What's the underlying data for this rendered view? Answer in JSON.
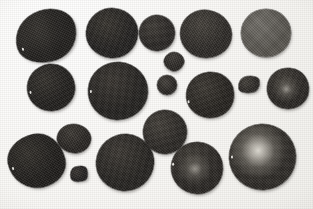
{
  "figure": {
    "width": 313,
    "height": 209,
    "background_color": "#f7f6f3",
    "paper_tone": "#fbfaf8",
    "specimen_dark": "#262421",
    "specimen_mid": "#4a4844",
    "specimen_light": "#6e6c66",
    "highlight_color": "#d8d5cd",
    "specimen_count": 19
  },
  "specimens": [
    {
      "id": "specimen-01",
      "label": "large irregular oval, upper left",
      "x": 15,
      "y": 10,
      "w": 62,
      "h": 52,
      "rotate": -18,
      "radius": "52% 48% 46% 54% / 56% 44% 56% 44%",
      "tone": "#211f1d",
      "tone2": "#35322e",
      "highlight": "none",
      "speck": {
        "show": true,
        "x": 4,
        "y": 30
      }
    },
    {
      "id": "specimen-02",
      "label": "round, upper center-left",
      "x": 86,
      "y": 8,
      "w": 52,
      "h": 50,
      "rotate": 6,
      "radius": "50% 50% 48% 52% / 52% 48% 52% 48%",
      "tone": "#232120",
      "tone2": "#38352f",
      "highlight": "none",
      "speck": {
        "show": false,
        "x": 0,
        "y": 0
      }
    },
    {
      "id": "specimen-03",
      "label": "small round, upper center",
      "x": 139,
      "y": 15,
      "w": 36,
      "h": 36,
      "rotate": -4,
      "radius": "50%",
      "tone": "#2a2725",
      "tone2": "#403c37",
      "highlight": "none",
      "speck": {
        "show": false,
        "x": 0,
        "y": 0
      }
    },
    {
      "id": "specimen-04",
      "label": "round, upper center-right",
      "x": 180,
      "y": 10,
      "w": 52,
      "h": 48,
      "rotate": 10,
      "radius": "48% 52% 52% 48% / 50% 50% 50% 50%",
      "tone": "#2d2a27",
      "tone2": "#46423c",
      "highlight": "none",
      "speck": {
        "show": false,
        "x": 0,
        "y": 0
      }
    },
    {
      "id": "specimen-05",
      "label": "pale grey round, upper right",
      "x": 241,
      "y": 9,
      "w": 50,
      "h": 48,
      "rotate": 0,
      "radius": "50%",
      "tone": "#58554f",
      "tone2": "#73706a",
      "highlight": "none",
      "speck": {
        "show": false,
        "x": 0,
        "y": 0
      }
    },
    {
      "id": "specimen-06",
      "label": "small fragment, center",
      "x": 164,
      "y": 52,
      "w": 20,
      "h": 19,
      "rotate": 22,
      "radius": "48% 52% 44% 56% / 58% 42% 58% 42%",
      "tone": "#2a2724",
      "tone2": "#403c38",
      "highlight": "none",
      "speck": {
        "show": false,
        "x": 0,
        "y": 0
      }
    },
    {
      "id": "specimen-07",
      "label": "round, middle left",
      "x": 27,
      "y": 64,
      "w": 48,
      "h": 47,
      "rotate": -8,
      "radius": "52% 48% 50% 50% / 50% 52% 48% 50%",
      "tone": "#211f1d",
      "tone2": "#35322d",
      "highlight": "none",
      "speck": {
        "show": true,
        "x": 2,
        "y": 24
      }
    },
    {
      "id": "specimen-08",
      "label": "large round, middle center-left",
      "x": 88,
      "y": 62,
      "w": 60,
      "h": 58,
      "rotate": 4,
      "radius": "50% 50% 52% 48% / 50% 50% 50% 50%",
      "tone": "#242220",
      "tone2": "#3a3631",
      "highlight": "none",
      "speck": {
        "show": true,
        "x": 2,
        "y": 30
      }
    },
    {
      "id": "specimen-09",
      "label": "small round, middle center",
      "x": 157,
      "y": 75,
      "w": 20,
      "h": 20,
      "rotate": 0,
      "radius": "50%",
      "tone": "#2b2825",
      "tone2": "#423e39",
      "highlight": "none",
      "speck": {
        "show": false,
        "x": 0,
        "y": 0
      }
    },
    {
      "id": "specimen-10",
      "label": "round, middle center-right",
      "x": 186,
      "y": 72,
      "w": 48,
      "h": 46,
      "rotate": -6,
      "radius": "50% 50% 48% 52% / 52% 48% 50% 50%",
      "tone": "#26231f",
      "tone2": "#3d3933",
      "highlight": "none",
      "speck": {
        "show": true,
        "x": 1,
        "y": 26
      }
    },
    {
      "id": "specimen-11",
      "label": "small kidney fragment, middle right",
      "x": 238,
      "y": 76,
      "w": 22,
      "h": 17,
      "rotate": -10,
      "radius": "46% 54% 40% 60% / 62% 38% 62% 38%",
      "tone": "#2c2926",
      "tone2": "#44403a",
      "highlight": "none",
      "speck": {
        "show": false,
        "x": 0,
        "y": 0
      }
    },
    {
      "id": "specimen-12",
      "label": "round with centre gloss, right edge",
      "x": 267,
      "y": 68,
      "w": 42,
      "h": 41,
      "rotate": 6,
      "radius": "50% 48% 52% 50% / 50% 52% 48% 50%",
      "tone": "#2a2724",
      "tone2": "#413d37",
      "highlight": "soft",
      "speck": {
        "show": false,
        "x": 0,
        "y": 0
      }
    },
    {
      "id": "specimen-13",
      "label": "small oval, lower center-left",
      "x": 57,
      "y": 124,
      "w": 34,
      "h": 29,
      "rotate": 12,
      "radius": "50% 50% 48% 52% / 54% 46% 54% 46%",
      "tone": "#282522",
      "tone2": "#3e3a35",
      "highlight": "none",
      "speck": {
        "show": false,
        "x": 0,
        "y": 0
      }
    },
    {
      "id": "specimen-14",
      "label": "large lobed blob, lower left",
      "x": 8,
      "y": 134,
      "w": 57,
      "h": 54,
      "rotate": -12,
      "radius": "54% 46% 48% 52% / 44% 58% 42% 56%",
      "tone": "#1f1d1b",
      "tone2": "#33302b",
      "highlight": "none",
      "speck": {
        "show": true,
        "x": 3,
        "y": 28
      }
    },
    {
      "id": "specimen-15",
      "label": "small angular fragment, lower center-left",
      "x": 70,
      "y": 166,
      "w": 18,
      "h": 16,
      "rotate": -18,
      "radius": "42% 58% 30% 70% / 60% 34% 66% 40%",
      "tone": "#222020",
      "tone2": "#383430",
      "highlight": "none",
      "speck": {
        "show": false,
        "x": 0,
        "y": 0
      }
    },
    {
      "id": "specimen-16",
      "label": "large round, lower center",
      "x": 96,
      "y": 134,
      "w": 58,
      "h": 57,
      "rotate": 5,
      "radius": "50% 50% 50% 50% / 52% 48% 52% 48%",
      "tone": "#262421",
      "tone2": "#3c3833",
      "highlight": "none",
      "speck": {
        "show": false,
        "x": 0,
        "y": 0
      }
    },
    {
      "id": "specimen-17",
      "label": "round, lower center-right upper",
      "x": 143,
      "y": 110,
      "w": 44,
      "h": 44,
      "rotate": -5,
      "radius": "50%",
      "tone": "#2b2825",
      "tone2": "#44403a",
      "highlight": "none",
      "speck": {
        "show": false,
        "x": 0,
        "y": 0
      }
    },
    {
      "id": "specimen-18",
      "label": "round with gloss, lower right of centre",
      "x": 171,
      "y": 142,
      "w": 52,
      "h": 52,
      "rotate": 3,
      "radius": "50% 50% 48% 52% / 50% 50% 50% 50%",
      "tone": "#2a2724",
      "tone2": "#423e38",
      "highlight": "soft",
      "speck": {
        "show": true,
        "x": 1,
        "y": 22
      }
    },
    {
      "id": "specimen-19",
      "label": "largest round with bright gloss, lower right",
      "x": 229,
      "y": 124,
      "w": 67,
      "h": 66,
      "rotate": -3,
      "radius": "50% 50% 50% 50% / 50% 50% 50% 50%",
      "tone": "#2e2b27",
      "tone2": "#4a463f",
      "highlight": "bright",
      "speck": {
        "show": true,
        "x": 2,
        "y": 30
      }
    }
  ]
}
